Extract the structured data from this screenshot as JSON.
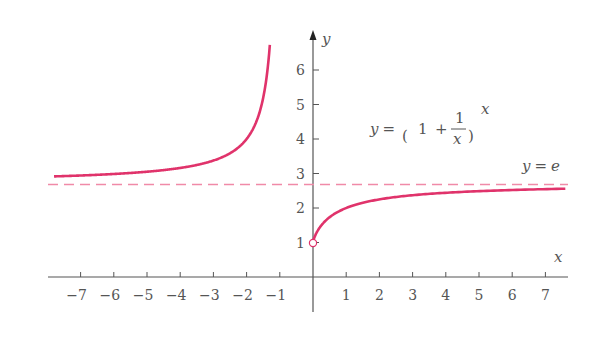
{
  "chart_data": {
    "type": "line",
    "title": "",
    "xlabel": "x",
    "ylabel": "y",
    "xlim": [
      -7.8,
      7.6
    ],
    "ylim": [
      0,
      7
    ],
    "grid": false,
    "x_ticks": [
      -7,
      -6,
      -5,
      -4,
      -3,
      -2,
      -1,
      1,
      2,
      3,
      4,
      5,
      6,
      7
    ],
    "x_tick_labels": [
      "−7",
      "−6",
      "−5",
      "−4",
      "−3",
      "−2",
      "−1",
      "1",
      "2",
      "3",
      "4",
      "5",
      "6",
      "7"
    ],
    "y_ticks": [
      1,
      2,
      3,
      4,
      5,
      6
    ],
    "y_tick_labels": [
      "1",
      "2",
      "3",
      "4",
      "5",
      "6"
    ],
    "series": [
      {
        "name": "y = (1 + 1/x)^x",
        "color": "#e0336b",
        "style": "solid",
        "branches": [
          {
            "domain": [
              -7.8,
              -1.3
            ],
            "description": "left branch, increases from ~2.9 toward +infinity as x -> -1"
          },
          {
            "domain": [
              0,
              7.6
            ],
            "description": "right branch, starts at open point (0,1), increases toward e"
          }
        ]
      },
      {
        "name": "y = e",
        "color": "#f08aa8",
        "style": "dashed",
        "value": 2.718
      }
    ],
    "annotations": [
      {
        "text": "y = (1 + 1/x)^x",
        "position": [
          2.4,
          4.3
        ]
      },
      {
        "text": "y = e",
        "position": [
          6.5,
          3.0
        ]
      },
      {
        "type": "open-circle",
        "at": [
          0,
          1
        ]
      }
    ]
  },
  "labels": {
    "x_axis": "x",
    "y_axis": "y",
    "formula_lhs": "y =",
    "formula_one": "1",
    "formula_plus": "+",
    "formula_num": "1",
    "formula_den": "x",
    "formula_exp": "x",
    "e_line": "y = e"
  },
  "ticks": {
    "x": [
      "−7",
      "−6",
      "−5",
      "−4",
      "−3",
      "−2",
      "−1",
      "1",
      "2",
      "3",
      "4",
      "5",
      "6",
      "7"
    ],
    "y": [
      "1",
      "2",
      "3",
      "4",
      "5",
      "6"
    ]
  },
  "colors": {
    "curve": "#e0336b",
    "asymptote": "#f08aa8",
    "axis": "#555555"
  }
}
